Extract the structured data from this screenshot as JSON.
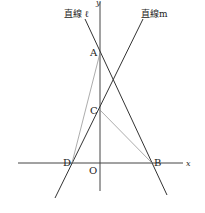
{
  "diagram": {
    "axes": {
      "x_label": "x",
      "y_label": "y",
      "origin_label": "O"
    },
    "lines": [
      {
        "name": "line-l",
        "label": "直線 ℓ",
        "through": [
          "A",
          "B"
        ]
      },
      {
        "name": "line-m",
        "label": "直線m",
        "through": [
          "C",
          "D"
        ]
      }
    ],
    "points": {
      "A": {
        "label": "A"
      },
      "B": {
        "label": "B"
      },
      "C": {
        "label": "C"
      },
      "D": {
        "label": "D"
      }
    },
    "segments": [
      {
        "from": "A",
        "to": "D"
      },
      {
        "from": "C",
        "to": "B"
      }
    ]
  }
}
